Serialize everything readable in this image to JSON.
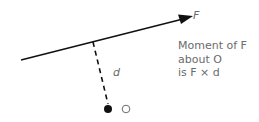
{
  "diagram": {
    "force_label": "F",
    "distance_label": "d",
    "point_label": "O",
    "caption": {
      "line1": "Moment of F",
      "line2": "about O",
      "line3": "is F × d"
    },
    "colors": {
      "line": "#111111",
      "text": "#6b6b6b"
    }
  }
}
